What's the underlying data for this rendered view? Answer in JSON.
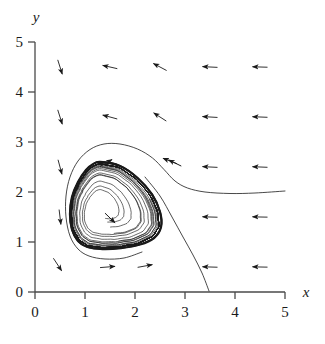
{
  "figure": {
    "kind": "phase-portrait",
    "background_color": "#ffffff",
    "ink_color": "#1a1a1a"
  },
  "axes": {
    "x_label": "x",
    "y_label": "y",
    "x_ticks": [
      "0",
      "1",
      "2",
      "3",
      "4",
      "5"
    ],
    "y_ticks": [
      "0",
      "1",
      "2",
      "3",
      "4",
      "5"
    ],
    "x_range": [
      0,
      5
    ],
    "y_range": [
      0,
      5
    ]
  },
  "chart_data": {
    "type": "scatter",
    "title": "",
    "xlabel": "x",
    "ylabel": "y",
    "xlim": [
      0,
      5
    ],
    "ylim": [
      0,
      5
    ],
    "xticks": [
      0,
      1,
      2,
      3,
      4,
      5
    ],
    "yticks": [
      0,
      1,
      2,
      3,
      4,
      5
    ],
    "grid": false,
    "legend": "none",
    "plot_kind": "phase portrait with direction field, limit cycle and unstable spiral",
    "direction_field": {
      "note": "arrows drawn at half-integer grid points; dx,dy are unit-ish direction components",
      "arrows": [
        {
          "x": 0.5,
          "y": 4.5,
          "dx": 0.3,
          "dy": -0.95
        },
        {
          "x": 1.5,
          "y": 4.5,
          "dx": -0.97,
          "dy": 0.22
        },
        {
          "x": 2.5,
          "y": 4.5,
          "dx": -0.88,
          "dy": 0.47
        },
        {
          "x": 3.5,
          "y": 4.5,
          "dx": -1.0,
          "dy": 0.05
        },
        {
          "x": 4.5,
          "y": 4.5,
          "dx": -1.0,
          "dy": 0.03
        },
        {
          "x": 0.5,
          "y": 3.5,
          "dx": 0.3,
          "dy": -0.95
        },
        {
          "x": 1.5,
          "y": 3.5,
          "dx": -0.96,
          "dy": 0.26
        },
        {
          "x": 2.5,
          "y": 3.5,
          "dx": -0.84,
          "dy": 0.54
        },
        {
          "x": 3.5,
          "y": 3.5,
          "dx": -1.0,
          "dy": 0.06
        },
        {
          "x": 4.5,
          "y": 3.5,
          "dx": -1.0,
          "dy": 0.04
        },
        {
          "x": 0.5,
          "y": 2.5,
          "dx": 0.26,
          "dy": -0.96
        },
        {
          "x": 2.7,
          "y": 2.62,
          "dx": -0.93,
          "dy": 0.36
        },
        {
          "x": 3.5,
          "y": 2.5,
          "dx": -1.0,
          "dy": 0.05
        },
        {
          "x": 4.5,
          "y": 2.5,
          "dx": -1.0,
          "dy": 0.04
        },
        {
          "x": 0.5,
          "y": 1.5,
          "dx": 0.12,
          "dy": -0.99
        },
        {
          "x": 3.5,
          "y": 1.5,
          "dx": -1.0,
          "dy": 0.03
        },
        {
          "x": 4.5,
          "y": 1.5,
          "dx": -1.0,
          "dy": 0.02
        },
        {
          "x": 0.45,
          "y": 0.55,
          "dx": 0.55,
          "dy": -0.84
        },
        {
          "x": 1.45,
          "y": 0.5,
          "dx": 1.0,
          "dy": 0.08
        },
        {
          "x": 2.2,
          "y": 0.52,
          "dx": 0.98,
          "dy": 0.18
        },
        {
          "x": 3.5,
          "y": 0.5,
          "dx": -1.0,
          "dy": 0.03
        },
        {
          "x": 4.5,
          "y": 0.5,
          "dx": -1.0,
          "dy": 0.02
        }
      ]
    },
    "equilibrium": {
      "x": 1.32,
      "y": 1.63,
      "type": "unstable spiral"
    },
    "limit_cycle": {
      "style": "bold closed curve",
      "direction": "counterclockwise",
      "points": [
        [
          1.3,
          2.6
        ],
        [
          1.7,
          2.52
        ],
        [
          2.05,
          2.28
        ],
        [
          2.34,
          1.95
        ],
        [
          2.5,
          1.6
        ],
        [
          2.52,
          1.3
        ],
        [
          2.38,
          1.08
        ],
        [
          2.1,
          0.95
        ],
        [
          1.72,
          0.88
        ],
        [
          1.35,
          0.86
        ],
        [
          1.05,
          0.9
        ],
        [
          0.86,
          1.02
        ],
        [
          0.74,
          1.25
        ],
        [
          0.7,
          1.56
        ],
        [
          0.74,
          1.9
        ],
        [
          0.86,
          2.2
        ],
        [
          1.02,
          2.44
        ],
        [
          1.15,
          2.55
        ],
        [
          1.3,
          2.6
        ]
      ]
    },
    "inner_spirals": {
      "count": 9,
      "description": "trajectories spiralling outward from the equilibrium toward the limit cycle"
    },
    "outer_trajectory": {
      "description": "trajectory entering from the right near y=2 and approaching the cycle from outside",
      "points": [
        [
          5.0,
          2.02
        ],
        [
          4.4,
          1.98
        ],
        [
          3.9,
          1.97
        ],
        [
          3.4,
          2.0
        ],
        [
          3.05,
          2.08
        ],
        [
          2.8,
          2.22
        ],
        [
          2.58,
          2.45
        ],
        [
          2.35,
          2.68
        ],
        [
          2.05,
          2.86
        ],
        [
          1.7,
          2.96
        ],
        [
          1.38,
          2.96
        ],
        [
          1.1,
          2.85
        ],
        [
          0.86,
          2.62
        ],
        [
          0.7,
          2.3
        ],
        [
          0.62,
          1.92
        ],
        [
          0.62,
          1.5
        ],
        [
          0.7,
          1.12
        ],
        [
          0.86,
          0.86
        ],
        [
          1.08,
          0.72
        ],
        [
          1.4,
          0.66
        ],
        [
          1.78,
          0.68
        ],
        [
          2.14,
          0.8
        ]
      ]
    },
    "separatrix": {
      "description": "curve leaving the cycle region and descending to the x-axis near x=3.5",
      "points": [
        [
          2.2,
          2.3
        ],
        [
          2.5,
          1.92
        ],
        [
          2.74,
          1.5
        ],
        [
          2.96,
          1.1
        ],
        [
          3.16,
          0.74
        ],
        [
          3.34,
          0.38
        ],
        [
          3.48,
          0.02
        ]
      ]
    }
  }
}
